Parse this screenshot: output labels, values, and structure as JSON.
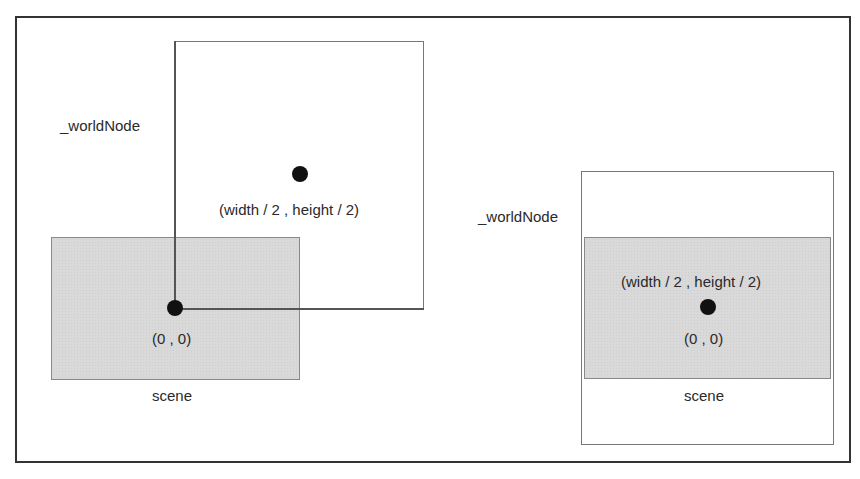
{
  "left_panel": {
    "world_label": "_worldNode",
    "center_label": "(width / 2 , height / 2)",
    "origin_label": "(0 , 0)",
    "scene_label": "scene"
  },
  "right_panel": {
    "world_label": "_worldNode",
    "center_label": "(width / 2 , height / 2)",
    "origin_label": "(0 , 0)",
    "scene_label": "scene"
  },
  "colors": {
    "frame": "#333333",
    "scene_fill": "#d9d9d9",
    "dot": "#111111"
  }
}
